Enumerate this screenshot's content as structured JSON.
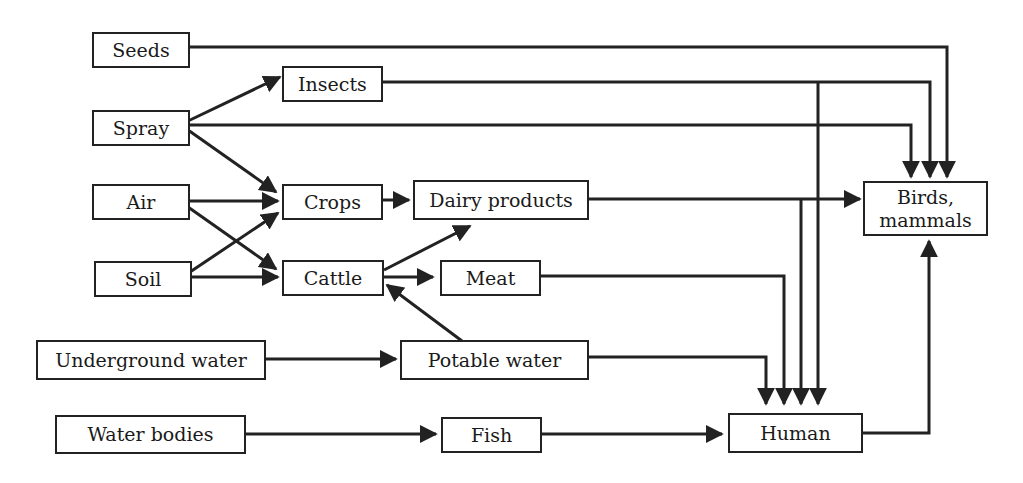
{
  "diagram": {
    "type": "flow-diagram",
    "title": "",
    "nodes": {
      "seeds": {
        "label": "Seeds"
      },
      "spray": {
        "label": "Spray"
      },
      "air": {
        "label": "Air"
      },
      "soil": {
        "label": "Soil"
      },
      "underground_water": {
        "label": "Underground water"
      },
      "water_bodies": {
        "label": "Water bodies"
      },
      "insects": {
        "label": "Insects"
      },
      "crops": {
        "label": "Crops"
      },
      "cattle": {
        "label": "Cattle"
      },
      "dairy_products": {
        "label": "Dairy products"
      },
      "meat": {
        "label": "Meat"
      },
      "potable_water": {
        "label": "Potable water"
      },
      "fish": {
        "label": "Fish"
      },
      "human": {
        "label": "Human"
      },
      "birds_mammals": {
        "label": "Birds,\nmammals"
      }
    },
    "edges": [
      {
        "from": "Seeds",
        "to": "Birds, mammals"
      },
      {
        "from": "Spray",
        "to": "Insects"
      },
      {
        "from": "Spray",
        "to": "Birds, mammals"
      },
      {
        "from": "Spray",
        "to": "Crops"
      },
      {
        "from": "Insects",
        "to": "Birds, mammals"
      },
      {
        "from": "Insects",
        "to": "Human"
      },
      {
        "from": "Air",
        "to": "Crops"
      },
      {
        "from": "Air",
        "to": "Cattle"
      },
      {
        "from": "Soil",
        "to": "Crops"
      },
      {
        "from": "Soil",
        "to": "Cattle"
      },
      {
        "from": "Crops",
        "to": "Dairy products"
      },
      {
        "from": "Cattle",
        "to": "Dairy products"
      },
      {
        "from": "Cattle",
        "to": "Meat"
      },
      {
        "from": "Potable water",
        "to": "Cattle"
      },
      {
        "from": "Dairy products",
        "to": "Birds, mammals"
      },
      {
        "from": "Dairy products",
        "to": "Human"
      },
      {
        "from": "Meat",
        "to": "Human"
      },
      {
        "from": "Underground water",
        "to": "Potable water"
      },
      {
        "from": "Potable water",
        "to": "Human"
      },
      {
        "from": "Water bodies",
        "to": "Fish"
      },
      {
        "from": "Fish",
        "to": "Human"
      },
      {
        "from": "Human",
        "to": "Birds, mammals"
      }
    ],
    "colors": {
      "line": "#222222",
      "box_border": "#222222",
      "background": "#ffffff"
    }
  }
}
